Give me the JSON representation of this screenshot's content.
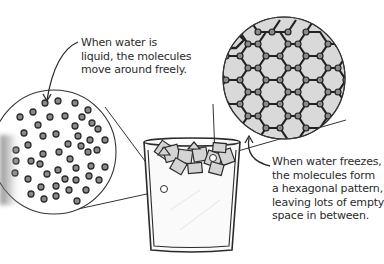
{
  "figure": {
    "labels": {
      "liquid": {
        "lines": [
          "When water is",
          "liquid, the molecules",
          "move around freely."
        ]
      },
      "ice": {
        "lines": [
          "When water freezes,",
          "the molecules form",
          "a hexagonal pattern,",
          "leaving lots of empty",
          "space in between."
        ]
      }
    },
    "elements": {
      "glass": "glass-of-ice-water",
      "liquid_zoom": "liquid-molecules-magnifier",
      "ice_zoom": "ice-hexagonal-lattice-magnifier"
    },
    "colors": {
      "ink": "#2b2b2b",
      "molecule_fill": "#8a8a8a",
      "ice_fill": "#d9d9d9",
      "ice_cube_fill": "#cfcfcf",
      "background": "#ffffff"
    }
  }
}
